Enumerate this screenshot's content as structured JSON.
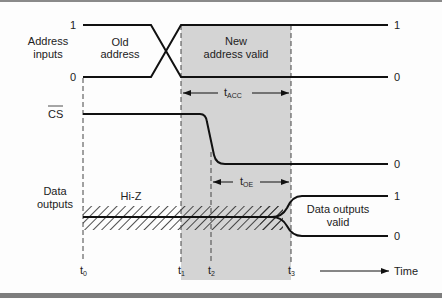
{
  "diagram": {
    "type": "timing-diagram",
    "signals": [
      {
        "id": "address",
        "label_line1": "Address",
        "label_line2": "inputs",
        "high_label": "1",
        "low_label": "0",
        "left_high": "1",
        "left_low": "0"
      },
      {
        "id": "cs",
        "label": "CS",
        "overbar": true,
        "right_label": "0"
      },
      {
        "id": "data",
        "label_line1": "Data",
        "label_line2": "outputs",
        "right_high": "1",
        "right_low": "0"
      }
    ],
    "annotations": {
      "old_address_line1": "Old",
      "old_address_line2": "address",
      "new_address_line1": "New",
      "new_address_line2": "address valid",
      "hi_z": "Hi-Z",
      "data_valid_line1": "Data outputs",
      "data_valid_line2": "valid",
      "t_acc": "t",
      "t_acc_sub": "ACC",
      "t_oe": "t",
      "t_oe_sub": "OE"
    },
    "time_markers": [
      {
        "label": "t",
        "sub": "0"
      },
      {
        "label": "t",
        "sub": "1"
      },
      {
        "label": "t",
        "sub": "2"
      },
      {
        "label": "t",
        "sub": "3"
      }
    ],
    "time_axis_label": "Time",
    "colors": {
      "line": "#111111",
      "shade": "#d4d4d4",
      "dash": "#444444",
      "frame": "#808080"
    }
  }
}
